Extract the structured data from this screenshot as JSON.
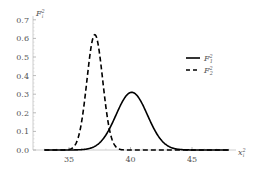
{
  "chart_data": {
    "type": "line",
    "title": "",
    "xlabel": "x_i^2",
    "ylabel": "F_i^2",
    "xlim": [
      32.2,
      48
    ],
    "ylim": [
      0,
      0.7
    ],
    "xticks": [
      35,
      40,
      45
    ],
    "yticks": [
      "0.0",
      "0.1",
      "0.2",
      "0.3",
      "0.4",
      "0.5",
      "0.6",
      "0.7"
    ],
    "grid": false,
    "legend_position": "upper right",
    "series": [
      {
        "name": "F_1^2",
        "style": "solid",
        "mean": 40.1,
        "sigma": 1.28,
        "peak": 0.31,
        "x": [
          33,
          34,
          35,
          36,
          37,
          38,
          38.5,
          39,
          39.5,
          40,
          40.1,
          40.5,
          41,
          41.5,
          42,
          43,
          44,
          45,
          46,
          47,
          48
        ],
        "y": [
          0.0,
          0.0,
          0.0,
          0.0,
          0.0,
          0.08,
          0.14,
          0.21,
          0.28,
          0.31,
          0.31,
          0.3,
          0.24,
          0.17,
          0.1,
          0.024,
          0.003,
          0.0,
          0.0,
          0.0,
          0.0
        ]
      },
      {
        "name": "F_2^2",
        "style": "dashed",
        "mean": 37.1,
        "sigma": 0.64,
        "peak": 0.62,
        "x": [
          33,
          34,
          35,
          35.5,
          36,
          36.5,
          37,
          37.1,
          37.5,
          38,
          38.5,
          39,
          40,
          41,
          42,
          43,
          44,
          45,
          46,
          47,
          48
        ],
        "y": [
          0.0,
          0.0,
          0.0,
          0.03,
          0.14,
          0.39,
          0.62,
          0.62,
          0.52,
          0.23,
          0.06,
          0.008,
          0.0,
          0.0,
          0.0,
          0.0,
          0.0,
          0.0,
          0.0,
          0.0,
          0.0
        ]
      }
    ]
  },
  "legend": {
    "items": [
      {
        "label": "F",
        "sup": "2",
        "sub": "1",
        "style": "solid"
      },
      {
        "label": "F",
        "sup": "2",
        "sub": "2",
        "style": "dashed"
      }
    ]
  },
  "axes": {
    "y_label": "F",
    "y_label_sup": "2",
    "y_label_sub": "i",
    "x_label": "x",
    "x_label_sup": "2",
    "x_label_sub": "i"
  }
}
